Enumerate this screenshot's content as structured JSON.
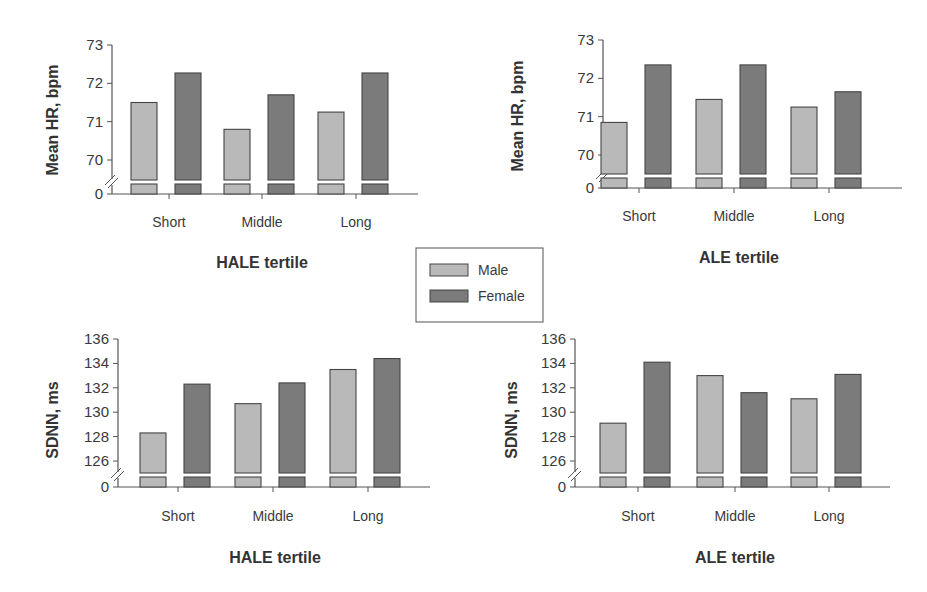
{
  "legend": {
    "items": [
      {
        "label": "Male",
        "color": "#b9b9b9"
      },
      {
        "label": "Female",
        "color": "#7b7b7b"
      }
    ]
  },
  "colors": {
    "male": "#b9b9b9",
    "female": "#7b7b7b",
    "bar_border": "#454545",
    "axis": "#555555"
  },
  "chart_data": [
    {
      "type": "bar",
      "title": "",
      "xlabel": "HALE tertile",
      "ylabel": "Mean HR, bpm",
      "categories": [
        "Short",
        "Middle",
        "Long"
      ],
      "yticks": [
        "0",
        "70",
        "71",
        "72",
        "73"
      ],
      "ylim": [
        69.6,
        73
      ],
      "axis_break": true,
      "series": [
        {
          "name": "Male",
          "values": [
            71.5,
            70.8,
            71.25
          ]
        },
        {
          "name": "Female",
          "values": [
            72.27,
            71.7,
            72.27
          ]
        }
      ]
    },
    {
      "type": "bar",
      "title": "",
      "xlabel": "ALE tertile",
      "ylabel": "Mean HR, bpm",
      "categories": [
        "Short",
        "Middle",
        "Long"
      ],
      "yticks": [
        "0",
        "70",
        "71",
        "72",
        "73"
      ],
      "ylim": [
        69.6,
        73
      ],
      "axis_break": true,
      "series": [
        {
          "name": "Male",
          "values": [
            70.85,
            71.45,
            71.25
          ]
        },
        {
          "name": "Female",
          "values": [
            72.35,
            72.35,
            71.65
          ]
        }
      ]
    },
    {
      "type": "bar",
      "title": "",
      "xlabel": "HALE tertile",
      "ylabel": "SDNN, ms",
      "categories": [
        "Short",
        "Middle",
        "Long"
      ],
      "yticks": [
        "0",
        "126",
        "128",
        "130",
        "132",
        "134",
        "136"
      ],
      "ylim": [
        125,
        136
      ],
      "axis_break": true,
      "series": [
        {
          "name": "Male",
          "values": [
            128.3,
            130.7,
            133.5
          ]
        },
        {
          "name": "Female",
          "values": [
            132.3,
            132.4,
            134.4
          ]
        }
      ]
    },
    {
      "type": "bar",
      "title": "",
      "xlabel": "ALE tertile",
      "ylabel": "SDNN, ms",
      "categories": [
        "Short",
        "Middle",
        "Long"
      ],
      "yticks": [
        "0",
        "126",
        "128",
        "130",
        "132",
        "134",
        "136"
      ],
      "ylim": [
        125,
        136
      ],
      "axis_break": true,
      "series": [
        {
          "name": "Male",
          "values": [
            129.1,
            133.0,
            131.1
          ]
        },
        {
          "name": "Female",
          "values": [
            134.1,
            131.6,
            133.1
          ]
        }
      ]
    }
  ]
}
